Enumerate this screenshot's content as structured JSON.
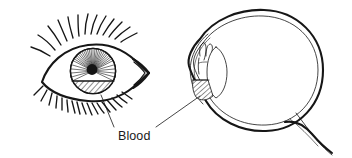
{
  "figure": {
    "background_color": "#ffffff",
    "ink_color": "#161616",
    "title": "",
    "labels": [
      {
        "id": "blood",
        "text": "Blood",
        "x": 118,
        "y": 137,
        "leader_lines": [
          {
            "from_x": 114,
            "from_y": 127,
            "to_x": 101,
            "to_y": 95
          },
          {
            "from_x": 155,
            "from_y": 127,
            "to_x": 200,
            "to_y": 96
          }
        ]
      }
    ],
    "panels": [
      {
        "id": "front-view-eye",
        "name": "external-eye-front-view",
        "description": "Front view of an eye with upper and lower eyelashes, iris with radial striations, dark central pupil, and a hatched blood layer pooling across the lower portion of the iris",
        "parts": [
          {
            "name": "upper-eyelid",
            "style": "thick-stroke"
          },
          {
            "name": "lower-eyelid",
            "style": "thick-stroke"
          },
          {
            "name": "outer-canthus",
            "style": "thick-stroke"
          },
          {
            "name": "upper-eyelashes",
            "count": 13
          },
          {
            "name": "lower-eyelashes",
            "count": 17
          },
          {
            "name": "iris",
            "center_x": 93,
            "center_y": 71,
            "radius": 23
          },
          {
            "name": "iris-striations",
            "count": 36
          },
          {
            "name": "pupil",
            "center_x": 92,
            "center_y": 69,
            "radius": 5.4,
            "fill": "#141414"
          },
          {
            "name": "blood-hatching",
            "fill_pattern": "diagonal-hatch",
            "region": "lower-iris"
          }
        ]
      },
      {
        "id": "cross-section-eye",
        "name": "eyeball-cross-section",
        "description": "Sagittal cross-section of the eyeball showing the scleral wall as a double line, the cornea, ciliary body, lens, optic nerve at lower right, and a hatched blood pool in the anterior chamber",
        "parts": [
          {
            "name": "sclera-outer-wall",
            "style": "thick-stroke"
          },
          {
            "name": "retina-inner-wall",
            "style": "thin-stroke"
          },
          {
            "name": "cornea",
            "style": "thin-stroke"
          },
          {
            "name": "ciliary-body",
            "style": "thin-stroke"
          },
          {
            "name": "lens",
            "style": "thin-stroke"
          },
          {
            "name": "optic-nerve",
            "style": "mixed-stroke"
          },
          {
            "name": "blood-hatching",
            "fill_pattern": "diagonal-hatch",
            "region": "anterior-chamber-inferior"
          }
        ]
      }
    ]
  }
}
